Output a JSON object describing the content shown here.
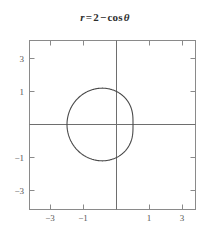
{
  "figure": {
    "title_parts": {
      "var": "r",
      "equals": "=",
      "constant": "2",
      "minus": "−",
      "func": "cos",
      "angle": "θ"
    },
    "title_text": "r = 2 − cos θ",
    "colors": {
      "curve": "#4a4a4a",
      "axis": "#6e6e6e",
      "frame": "#8a8a8a",
      "tick_label": "#555555",
      "title": "#2e2e2e",
      "background": "#ffffff"
    }
  },
  "chart_data": {
    "type": "line",
    "subtitle": "",
    "plot_kind": "polar-limacon",
    "equation": "r = 2 - cos(theta)",
    "xlabel": "",
    "ylabel": "",
    "xlim": [
      -4,
      4
    ],
    "ylim": [
      -4,
      4
    ],
    "grid": false,
    "legend": null,
    "xticks": [
      -3,
      -1,
      1,
      3
    ],
    "yticks": [
      -3,
      -1,
      1,
      3
    ],
    "xtick_labels": [
      "−3",
      "−1",
      "1",
      "3"
    ],
    "ytick_labels": [
      "−3",
      "−1",
      "1",
      "3"
    ],
    "axes_through_origin": true,
    "series": [
      {
        "name": "r = 2 - cos θ",
        "theta_range_deg": [
          0,
          360
        ],
        "r_formula": "2 - cos(theta)",
        "key_points": [
          {
            "theta_deg": 0,
            "r": 1,
            "x": 1,
            "y": 0
          },
          {
            "theta_deg": 90,
            "r": 2,
            "x": 0,
            "y": 2
          },
          {
            "theta_deg": 180,
            "r": 3,
            "x": -3,
            "y": 0
          },
          {
            "theta_deg": 270,
            "r": 2,
            "x": 0,
            "y": -2
          }
        ],
        "x_extent": [
          -3,
          1
        ],
        "y_extent": [
          -2.1,
          2.1
        ]
      }
    ]
  }
}
